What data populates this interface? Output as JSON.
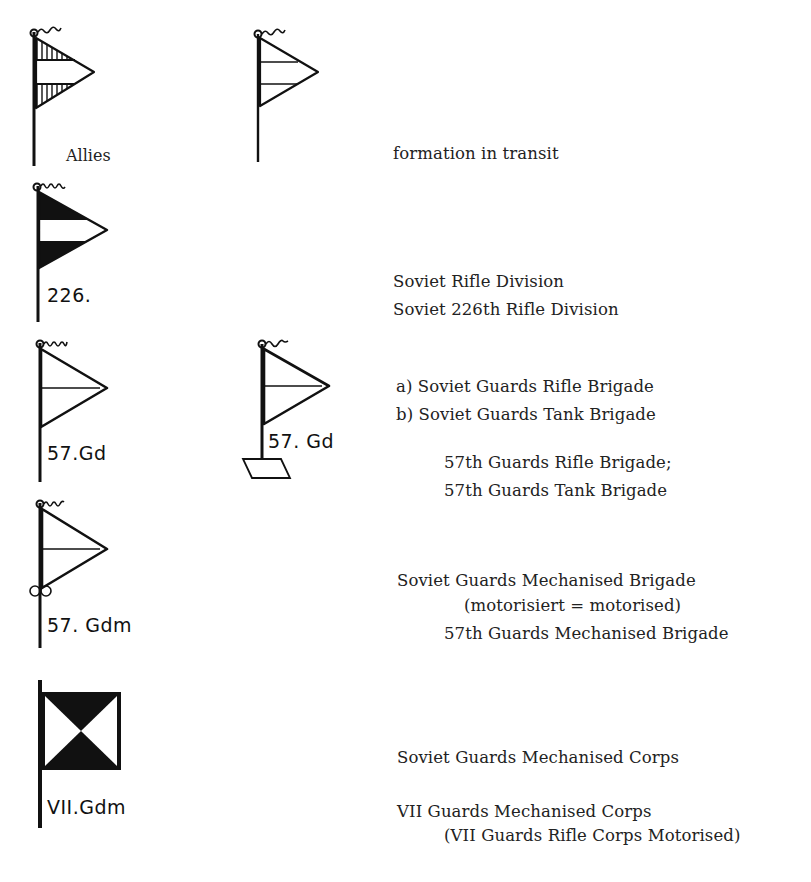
{
  "legend": {
    "rows": [
      {
        "id": "allies-transit",
        "symbols": [
          {
            "name": "allies-flag",
            "label": "Allies",
            "style": "hatched-bands"
          },
          {
            "name": "transit-flag",
            "label": "",
            "style": "outline-three-bands"
          }
        ],
        "descriptions": [
          "formation in transit"
        ]
      },
      {
        "id": "rifle-division",
        "symbols": [
          {
            "name": "rifle-division-flag",
            "label": "226.",
            "style": "black-white-black-bands"
          }
        ],
        "descriptions": [
          "Soviet Rifle Division",
          "Soviet 226th Rifle Division"
        ]
      },
      {
        "id": "guards-brigade",
        "symbols": [
          {
            "name": "guards-rifle-brigade-flag",
            "label": "57.Gd",
            "style": "outline-two-halves"
          },
          {
            "name": "guards-tank-brigade-flag",
            "label": "57. Gd",
            "style": "outline-two-halves-with-base"
          }
        ],
        "descriptions": [
          "a) Soviet Guards Rifle Brigade",
          "b) Soviet Guards Tank Brigade",
          "57th Guards Rifle Brigade;",
          "57th Guards Tank Brigade"
        ]
      },
      {
        "id": "guards-mech-brigade",
        "symbols": [
          {
            "name": "guards-mech-brigade-flag",
            "label": "57. Gdm",
            "style": "outline-two-halves-with-wheels"
          }
        ],
        "descriptions": [
          "Soviet Guards Mechanised Brigade",
          "(motorisiert = motorised)",
          "57th Guards Mechanised Brigade"
        ]
      },
      {
        "id": "guards-mech-corps",
        "symbols": [
          {
            "name": "guards-mech-corps-flag",
            "label": "VII.Gdm",
            "style": "square-hourglass"
          }
        ],
        "descriptions": [
          "Soviet Guards Mechanised Corps",
          "VII Guards Mechanised Corps",
          "(VII Guards Rifle Corps Motorised)"
        ]
      }
    ]
  },
  "colors": {
    "ink": "#111111",
    "paper": "#ffffff",
    "text": "#222222"
  }
}
